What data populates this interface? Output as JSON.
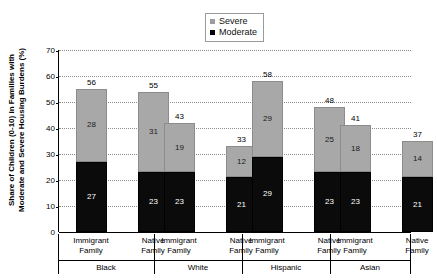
{
  "chart_data": {
    "type": "bar",
    "subtype": "stacked-bar",
    "title": "",
    "xlabel": "",
    "ylabel": "Share of Children (0-10) in Families with Moderate and Severe Housing Burdens (%)",
    "ylim": [
      0,
      70
    ],
    "ytick_step": 10,
    "yticks": [
      0,
      10,
      20,
      30,
      40,
      50,
      60,
      70
    ],
    "grid": true,
    "legend_position": "top-center",
    "groups": [
      "Black",
      "White",
      "Hispanic",
      "Asian"
    ],
    "categories": [
      "Immigrant Family",
      "Native Family",
      "Immigrant Family",
      "Native Family",
      "Immigrant Family",
      "Native Family",
      "Immigrant Family",
      "Native Family"
    ],
    "series": [
      {
        "name": "Moderate",
        "color": "#0b0b0b",
        "values": [
          27,
          23,
          23,
          21,
          29,
          23,
          23,
          21
        ]
      },
      {
        "name": "Severe",
        "color": "#a8a8a8",
        "values": [
          28,
          31,
          19,
          12,
          29,
          25,
          18,
          14
        ]
      }
    ],
    "totals": [
      56,
      55,
      43,
      33,
      58,
      48,
      41,
      37
    ]
  },
  "legend": {
    "items": [
      {
        "label": "Severe",
        "color": "#a8a8a8"
      },
      {
        "label": "Moderate",
        "color": "#0b0b0b"
      }
    ]
  },
  "axis": {
    "ylabel_line1": "Share of Children (0-10) in Families with",
    "ylabel_line2": "Moderate and Severe Housing Burdens (%)",
    "ytick_labels": [
      "70",
      "60",
      "50",
      "40",
      "30",
      "20",
      "10",
      "0"
    ]
  },
  "bars": [
    {
      "category_line1": "Immigrant",
      "category_line2": "Family",
      "total": "56",
      "severe": "28",
      "moderate": "27"
    },
    {
      "category_line1": "Native",
      "category_line2": "Family",
      "total": "55",
      "severe": "31",
      "moderate": "23"
    },
    {
      "category_line1": "Immigrant",
      "category_line2": "Family",
      "total": "43",
      "severe": "19",
      "moderate": "23"
    },
    {
      "category_line1": "Native",
      "category_line2": "Family",
      "total": "33",
      "severe": "12",
      "moderate": "21"
    },
    {
      "category_line1": "Immigrant",
      "category_line2": "Family",
      "total": "58",
      "severe": "29",
      "moderate": "29"
    },
    {
      "category_line1": "Native",
      "category_line2": "Family",
      "total": "48",
      "severe": "25",
      "moderate": "23"
    },
    {
      "category_line1": "Immigrant",
      "category_line2": "Family",
      "total": "41",
      "severe": "18",
      "moderate": "23"
    },
    {
      "category_line1": "Native",
      "category_line2": "Family",
      "total": "37",
      "severe": "14",
      "moderate": "21"
    }
  ],
  "group_labels": [
    {
      "label": "Black"
    },
    {
      "label": "White"
    },
    {
      "label": "Hispanic"
    },
    {
      "label": "Asian"
    }
  ]
}
